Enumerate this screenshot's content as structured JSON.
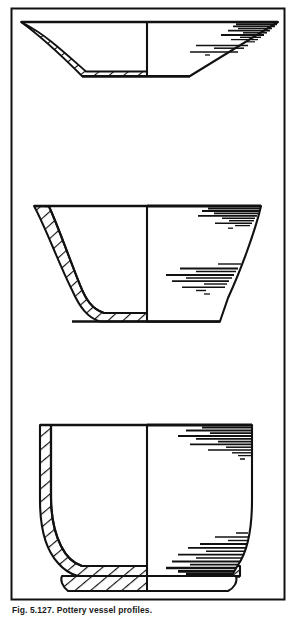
{
  "figure": {
    "type": "archaeological-vessel-profile-plate",
    "caption": "Fig. 5.127. Pottery vessel profiles.",
    "frame": {
      "x": 11,
      "y": 8,
      "width": 274,
      "height": 592,
      "stroke_color": "#111111",
      "stroke_width": 2,
      "fill_color": "#ffffff"
    },
    "ink_color": "#111111",
    "background_color": "#ffffff",
    "center_axis_label": "profile-section-axis",
    "vessels": [
      {
        "id": "vessel-1",
        "name": "shallow-open-bowl",
        "label": "top",
        "rim_left_x": 21,
        "rim_right_x": 278,
        "rim_y": 22,
        "base_left_x": 82,
        "base_right_x": 190,
        "base_y": 76,
        "axis_x": 147,
        "section_side": "left",
        "shading_side": "right",
        "hatch_count": 17,
        "shade_line_count": 9
      },
      {
        "id": "vessel-2",
        "name": "deep-flaring-bowl",
        "label": "middle",
        "rim_left_x": 34,
        "rim_right_x": 261,
        "rim_y": 205,
        "base_left_x": 73,
        "base_right_x": 220,
        "base_y": 322,
        "axis_x": 147,
        "section_side": "left",
        "shading_side": "right",
        "hatch_count": 20,
        "shade_line_count": 18
      },
      {
        "id": "vessel-3",
        "name": "deep-bucket-cup-with-footring",
        "label": "bottom",
        "rim_left_x": 40,
        "rim_right_x": 252,
        "rim_y": 425,
        "base_left_x": 55,
        "base_right_x": 240,
        "base_y": 578,
        "footring_y": 590,
        "axis_x": 147,
        "section_side": "left",
        "shading_side": "right",
        "hatch_count": 24,
        "shade_line_count": 22
      }
    ]
  }
}
